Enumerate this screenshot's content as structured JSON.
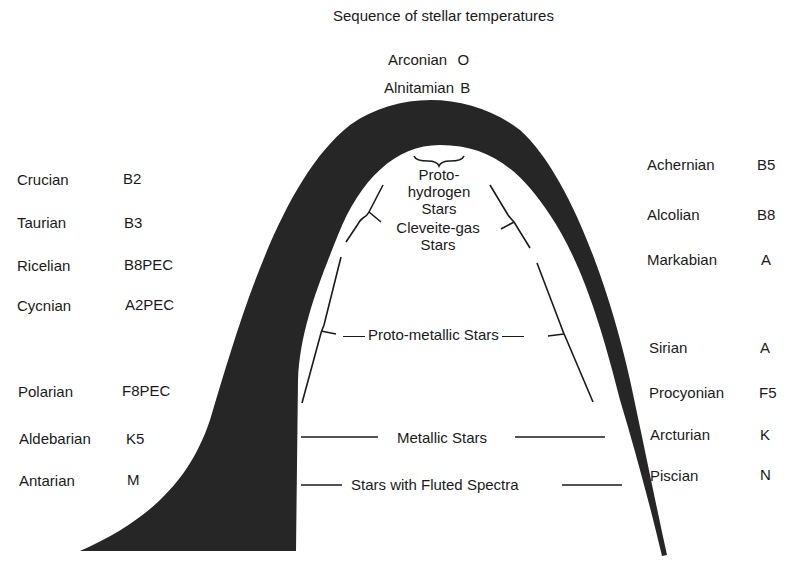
{
  "title": "Sequence of stellar temperatures",
  "apex": [
    {
      "name": "Arconian",
      "class": "O"
    },
    {
      "name": "Alnitamian",
      "class": "B"
    }
  ],
  "left_column": [
    {
      "name": "Crucian",
      "class": "B2"
    },
    {
      "name": "Taurian",
      "class": "B3"
    },
    {
      "name": "Ricelian",
      "class": "B8PEC"
    },
    {
      "name": "Cycnian",
      "class": "A2PEC"
    },
    {
      "name": "Polarian",
      "class": "F8PEC"
    },
    {
      "name": "Aldebarian",
      "class": "K5"
    },
    {
      "name": "Antarian",
      "class": "M"
    }
  ],
  "right_column": [
    {
      "name": "Achernian",
      "class": "B5"
    },
    {
      "name": "Alcolian",
      "class": "B8"
    },
    {
      "name": "Markabian",
      "class": "A"
    },
    {
      "name": "Sirian",
      "class": "A"
    },
    {
      "name": "Procyonian",
      "class": "F5"
    },
    {
      "name": "Arcturian",
      "class": "K"
    },
    {
      "name": "Piscian",
      "class": "N"
    }
  ],
  "inner_labels": {
    "proto_hydrogen": [
      "Proto-",
      "hydrogen",
      "Stars"
    ],
    "cleveite_gas": [
      "Cleveite-gas",
      "Stars"
    ],
    "proto_metallic": "Proto-metallic Stars",
    "metallic": "Metallic Stars",
    "fluted": "Stars with Fluted Spectra"
  },
  "colors": {
    "arch_fill": "#262626",
    "text": "#1a1a1a",
    "background": "#ffffff"
  }
}
